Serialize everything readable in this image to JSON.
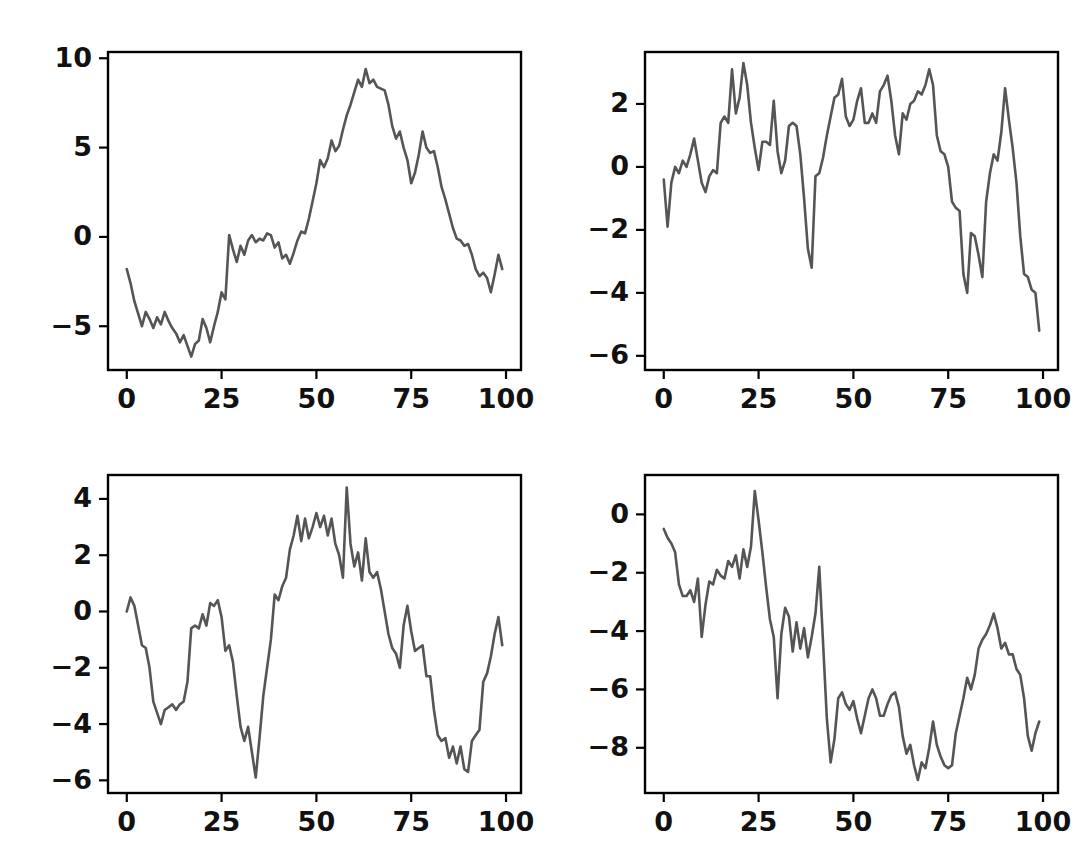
{
  "figure": {
    "background_color": "#ffffff",
    "rows": 2,
    "cols": 2,
    "width": 1075,
    "height": 847
  },
  "chart_data": [
    {
      "type": "line",
      "panel": "top-left",
      "title": "",
      "xlabel": "",
      "ylabel": "",
      "line_color": "#555555",
      "grid": false,
      "legend": null,
      "xlim": [
        -4.95,
        103.95
      ],
      "ylim": [
        -7.45,
        10.35
      ],
      "xticks": [
        0,
        25,
        50,
        75,
        100
      ],
      "yticks": [
        -5,
        0,
        5,
        10
      ],
      "xticklabels": [
        "0",
        "25",
        "50",
        "75",
        "100"
      ],
      "yticklabels": [
        "−5",
        "0",
        "5",
        "10"
      ],
      "x": [
        0,
        1,
        2,
        3,
        4,
        5,
        6,
        7,
        8,
        9,
        10,
        11,
        12,
        13,
        14,
        15,
        16,
        17,
        18,
        19,
        20,
        21,
        22,
        23,
        24,
        25,
        26,
        27,
        28,
        29,
        30,
        31,
        32,
        33,
        34,
        35,
        36,
        37,
        38,
        39,
        40,
        41,
        42,
        43,
        44,
        45,
        46,
        47,
        48,
        49,
        50,
        51,
        52,
        53,
        54,
        55,
        56,
        57,
        58,
        59,
        60,
        61,
        62,
        63,
        64,
        65,
        66,
        67,
        68,
        69,
        70,
        71,
        72,
        73,
        74,
        75,
        76,
        77,
        78,
        79,
        80,
        81,
        82,
        83,
        84,
        85,
        86,
        87,
        88,
        89,
        90,
        91,
        92,
        93,
        94,
        95,
        96,
        97,
        98,
        99
      ],
      "values": [
        -1.8,
        -2.6,
        -3.6,
        -4.3,
        -5.0,
        -4.2,
        -4.6,
        -5.1,
        -4.5,
        -4.9,
        -4.2,
        -4.7,
        -5.1,
        -5.4,
        -5.9,
        -5.5,
        -6.1,
        -6.7,
        -6.0,
        -5.8,
        -4.6,
        -5.1,
        -5.9,
        -5.0,
        -4.2,
        -3.1,
        -3.5,
        0.1,
        -0.7,
        -1.4,
        -0.5,
        -1.0,
        -0.2,
        0.1,
        -0.3,
        -0.1,
        -0.2,
        0.2,
        0.1,
        -0.6,
        -0.3,
        -1.2,
        -1.0,
        -1.5,
        -0.9,
        -0.2,
        0.3,
        0.2,
        1.0,
        2.0,
        3.0,
        4.3,
        3.9,
        4.4,
        5.4,
        4.8,
        5.1,
        6.0,
        6.8,
        7.4,
        8.1,
        8.8,
        8.4,
        9.4,
        8.6,
        8.8,
        8.4,
        8.3,
        8.2,
        7.4,
        6.2,
        5.5,
        5.9,
        5.0,
        4.3,
        3.0,
        3.6,
        4.6,
        5.9,
        5.0,
        4.7,
        4.8,
        3.9,
        2.8,
        2.1,
        1.3,
        0.5,
        -0.1,
        -0.2,
        -0.5,
        -0.4,
        -1.0,
        -1.8,
        -2.2,
        -2.0,
        -2.3,
        -3.1,
        -2.1,
        -1.0,
        -1.8,
        -1.5
      ]
    },
    {
      "type": "line",
      "panel": "top-right",
      "title": "",
      "xlabel": "",
      "ylabel": "",
      "line_color": "#555555",
      "grid": false,
      "legend": null,
      "xlim": [
        -4.95,
        103.95
      ],
      "ylim": [
        -6.45,
        3.65
      ],
      "xticks": [
        0,
        25,
        50,
        75,
        100
      ],
      "yticks": [
        -6,
        -4,
        -2,
        0,
        2
      ],
      "xticklabels": [
        "0",
        "25",
        "50",
        "75",
        "100"
      ],
      "yticklabels": [
        "−6",
        "−4",
        "−2",
        "0",
        "2"
      ],
      "x": [
        0,
        1,
        2,
        3,
        4,
        5,
        6,
        7,
        8,
        9,
        10,
        11,
        12,
        13,
        14,
        15,
        16,
        17,
        18,
        19,
        20,
        21,
        22,
        23,
        24,
        25,
        26,
        27,
        28,
        29,
        30,
        31,
        32,
        33,
        34,
        35,
        36,
        37,
        38,
        39,
        40,
        41,
        42,
        43,
        44,
        45,
        46,
        47,
        48,
        49,
        50,
        51,
        52,
        53,
        54,
        55,
        56,
        57,
        58,
        59,
        60,
        61,
        62,
        63,
        64,
        65,
        66,
        67,
        68,
        69,
        70,
        71,
        72,
        73,
        74,
        75,
        76,
        77,
        78,
        79,
        80,
        81,
        82,
        83,
        84,
        85,
        86,
        87,
        88,
        89,
        90,
        91,
        92,
        93,
        94,
        95,
        96,
        97,
        98,
        99
      ],
      "values": [
        -0.4,
        -1.9,
        -0.5,
        0.0,
        -0.2,
        0.2,
        0.0,
        0.4,
        0.9,
        0.2,
        -0.5,
        -0.8,
        -0.3,
        -0.1,
        -0.2,
        1.4,
        1.6,
        1.4,
        3.1,
        1.7,
        2.2,
        3.3,
        2.6,
        1.4,
        0.6,
        -0.1,
        0.8,
        0.8,
        0.7,
        2.1,
        0.5,
        -0.2,
        0.2,
        1.3,
        1.4,
        1.3,
        0.4,
        -1.0,
        -2.6,
        -3.2,
        -0.3,
        -0.2,
        0.3,
        1.0,
        1.6,
        2.2,
        2.3,
        2.8,
        1.6,
        1.3,
        1.5,
        2.1,
        2.5,
        1.4,
        1.4,
        1.7,
        1.4,
        2.4,
        2.6,
        2.9,
        2.1,
        1.0,
        0.4,
        1.7,
        1.5,
        2.0,
        2.1,
        2.4,
        2.3,
        2.6,
        3.1,
        2.6,
        1.0,
        0.5,
        0.4,
        0.0,
        -1.1,
        -1.3,
        -1.4,
        -3.4,
        -4.0,
        -2.1,
        -2.2,
        -2.8,
        -3.5,
        -1.1,
        -0.2,
        0.4,
        0.2,
        1.1,
        2.5,
        1.5,
        0.6,
        -0.5,
        -2.2,
        -3.4,
        -3.5,
        -3.9,
        -4.0,
        -5.2,
        -6.0
      ]
    },
    {
      "type": "line",
      "panel": "bottom-left",
      "title": "",
      "xlabel": "",
      "ylabel": "",
      "line_color": "#555555",
      "grid": false,
      "legend": null,
      "xlim": [
        -4.95,
        103.95
      ],
      "ylim": [
        -6.45,
        4.85
      ],
      "xticks": [
        0,
        25,
        50,
        75,
        100
      ],
      "yticks": [
        -6,
        -4,
        -2,
        0,
        2,
        4
      ],
      "xticklabels": [
        "0",
        "25",
        "50",
        "75",
        "100"
      ],
      "yticklabels": [
        "−6",
        "−4",
        "−2",
        "0",
        "2",
        "4"
      ],
      "x": [
        0,
        1,
        2,
        3,
        4,
        5,
        6,
        7,
        8,
        9,
        10,
        11,
        12,
        13,
        14,
        15,
        16,
        17,
        18,
        19,
        20,
        21,
        22,
        23,
        24,
        25,
        26,
        27,
        28,
        29,
        30,
        31,
        32,
        33,
        34,
        35,
        36,
        37,
        38,
        39,
        40,
        41,
        42,
        43,
        44,
        45,
        46,
        47,
        48,
        49,
        50,
        51,
        52,
        53,
        54,
        55,
        56,
        57,
        58,
        59,
        60,
        61,
        62,
        63,
        64,
        65,
        66,
        67,
        68,
        69,
        70,
        71,
        72,
        73,
        74,
        75,
        76,
        77,
        78,
        79,
        80,
        81,
        82,
        83,
        84,
        85,
        86,
        87,
        88,
        89,
        90,
        91,
        92,
        93,
        94,
        95,
        96,
        97,
        98,
        99
      ],
      "values": [
        0.0,
        0.5,
        0.2,
        -0.5,
        -1.2,
        -1.3,
        -2.0,
        -3.2,
        -3.6,
        -4.0,
        -3.5,
        -3.4,
        -3.3,
        -3.5,
        -3.3,
        -3.2,
        -2.5,
        -0.6,
        -0.5,
        -0.6,
        -0.1,
        -0.5,
        0.3,
        0.2,
        0.4,
        -0.2,
        -1.4,
        -1.2,
        -1.8,
        -3.0,
        -4.1,
        -4.6,
        -4.1,
        -5.0,
        -5.9,
        -4.5,
        -3.0,
        -2.0,
        -1.0,
        0.6,
        0.4,
        0.9,
        1.2,
        2.2,
        2.7,
        3.4,
        2.5,
        3.3,
        2.6,
        3.0,
        3.5,
        3.0,
        3.4,
        2.7,
        3.3,
        2.4,
        2.0,
        1.2,
        4.4,
        2.4,
        1.6,
        2.1,
        1.1,
        2.6,
        1.4,
        1.2,
        1.4,
        0.8,
        0.0,
        -0.8,
        -1.3,
        -1.5,
        -2.0,
        -0.5,
        0.2,
        -0.7,
        -1.4,
        -1.3,
        -1.2,
        -2.3,
        -2.3,
        -3.5,
        -4.4,
        -4.6,
        -4.5,
        -5.2,
        -4.8,
        -5.4,
        -4.8,
        -5.6,
        -5.7,
        -4.6,
        -4.4,
        -4.2,
        -2.5,
        -2.2,
        -1.6,
        -0.8,
        -0.2,
        -1.2,
        -2.4
      ]
    },
    {
      "type": "line",
      "panel": "bottom-right",
      "title": "",
      "xlabel": "",
      "ylabel": "",
      "line_color": "#555555",
      "grid": false,
      "legend": null,
      "xlim": [
        -4.95,
        103.95
      ],
      "ylim": [
        -9.55,
        1.35
      ],
      "xticks": [
        0,
        25,
        50,
        75,
        100
      ],
      "yticks": [
        -8,
        -6,
        -4,
        -2,
        0
      ],
      "xticklabels": [
        "0",
        "25",
        "50",
        "75",
        "100"
      ],
      "yticklabels": [
        "−8",
        "−6",
        "−4",
        "−2",
        "0"
      ],
      "x": [
        0,
        1,
        2,
        3,
        4,
        5,
        6,
        7,
        8,
        9,
        10,
        11,
        12,
        13,
        14,
        15,
        16,
        17,
        18,
        19,
        20,
        21,
        22,
        23,
        24,
        25,
        26,
        27,
        28,
        29,
        30,
        31,
        32,
        33,
        34,
        35,
        36,
        37,
        38,
        39,
        40,
        41,
        42,
        43,
        44,
        45,
        46,
        47,
        48,
        49,
        50,
        51,
        52,
        53,
        54,
        55,
        56,
        57,
        58,
        59,
        60,
        61,
        62,
        63,
        64,
        65,
        66,
        67,
        68,
        69,
        70,
        71,
        72,
        73,
        74,
        75,
        76,
        77,
        78,
        79,
        80,
        81,
        82,
        83,
        84,
        85,
        86,
        87,
        88,
        89,
        90,
        91,
        92,
        93,
        94,
        95,
        96,
        97,
        98,
        99
      ],
      "values": [
        -0.5,
        -0.8,
        -1.0,
        -1.3,
        -2.4,
        -2.8,
        -2.8,
        -2.6,
        -3.0,
        -2.2,
        -4.2,
        -3.1,
        -2.3,
        -2.4,
        -1.9,
        -2.1,
        -2.2,
        -1.6,
        -1.8,
        -1.4,
        -2.2,
        -1.2,
        -1.8,
        -1.1,
        0.8,
        -0.2,
        -1.3,
        -2.5,
        -3.6,
        -4.2,
        -6.3,
        -4.1,
        -3.2,
        -3.5,
        -4.7,
        -3.7,
        -4.6,
        -3.9,
        -4.9,
        -4.2,
        -3.4,
        -1.8,
        -4.4,
        -7.0,
        -8.5,
        -7.7,
        -6.3,
        -6.1,
        -6.5,
        -6.7,
        -6.4,
        -7.0,
        -7.5,
        -6.9,
        -6.3,
        -6.0,
        -6.3,
        -6.9,
        -6.9,
        -6.5,
        -6.2,
        -6.1,
        -6.6,
        -7.6,
        -8.2,
        -7.9,
        -8.6,
        -9.1,
        -8.5,
        -8.7,
        -8.0,
        -7.1,
        -7.9,
        -8.3,
        -8.6,
        -8.7,
        -8.6,
        -7.5,
        -6.9,
        -6.3,
        -5.6,
        -6.0,
        -5.5,
        -4.6,
        -4.3,
        -4.1,
        -3.8,
        -3.4,
        -3.9,
        -4.6,
        -4.4,
        -4.8,
        -4.8,
        -5.3,
        -5.5,
        -6.3,
        -7.6,
        -8.1,
        -7.5,
        -7.1
      ]
    }
  ]
}
